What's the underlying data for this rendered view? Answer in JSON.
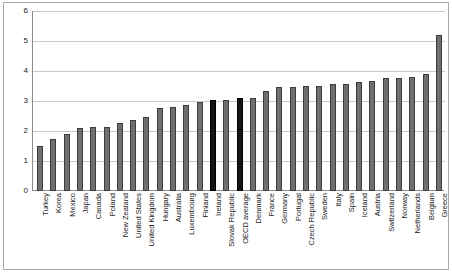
{
  "chart_data": {
    "type": "bar",
    "title": "",
    "subtitle": "",
    "xlabel": "",
    "ylabel": "",
    "ylim": [
      0,
      6
    ],
    "yticks": [
      0,
      1,
      2,
      3,
      4,
      5,
      6
    ],
    "ytick_labels": [
      "0",
      "1",
      "2",
      "3",
      "4",
      "5",
      "6"
    ],
    "grid": true,
    "legend": "none",
    "orientation": "vertical",
    "sorted": "ascending",
    "highlight_color": "#141414",
    "bar_color": "#6f6f6f",
    "highlighted_categories": [
      "Ireland",
      "OECD average"
    ],
    "categories": [
      "Turkey",
      "Korea",
      "Mexico",
      "Japan",
      "Canada",
      "Poland",
      "New Zealand",
      "United States",
      "United Kingdom",
      "Hungary",
      "Australia",
      "Luxembourg",
      "Finland",
      "Ireland",
      "Slovak Republic",
      "OECD average",
      "Denmark",
      "France",
      "Germany",
      "Portugal",
      "Czech Republic",
      "Sweden",
      "Italy",
      "Spain",
      "Iceland",
      "Austria",
      "Switzerland",
      "Norway",
      "Netherlands",
      "Belgium",
      "Greece"
    ],
    "values": [
      1.5,
      1.72,
      1.91,
      2.09,
      2.14,
      2.14,
      2.26,
      2.38,
      2.47,
      2.77,
      2.8,
      2.87,
      2.96,
      3.02,
      3.04,
      3.09,
      3.1,
      3.34,
      3.46,
      3.46,
      3.51,
      3.51,
      3.57,
      3.57,
      3.64,
      3.67,
      3.77,
      3.77,
      3.81,
      3.9,
      5.19
    ]
  }
}
